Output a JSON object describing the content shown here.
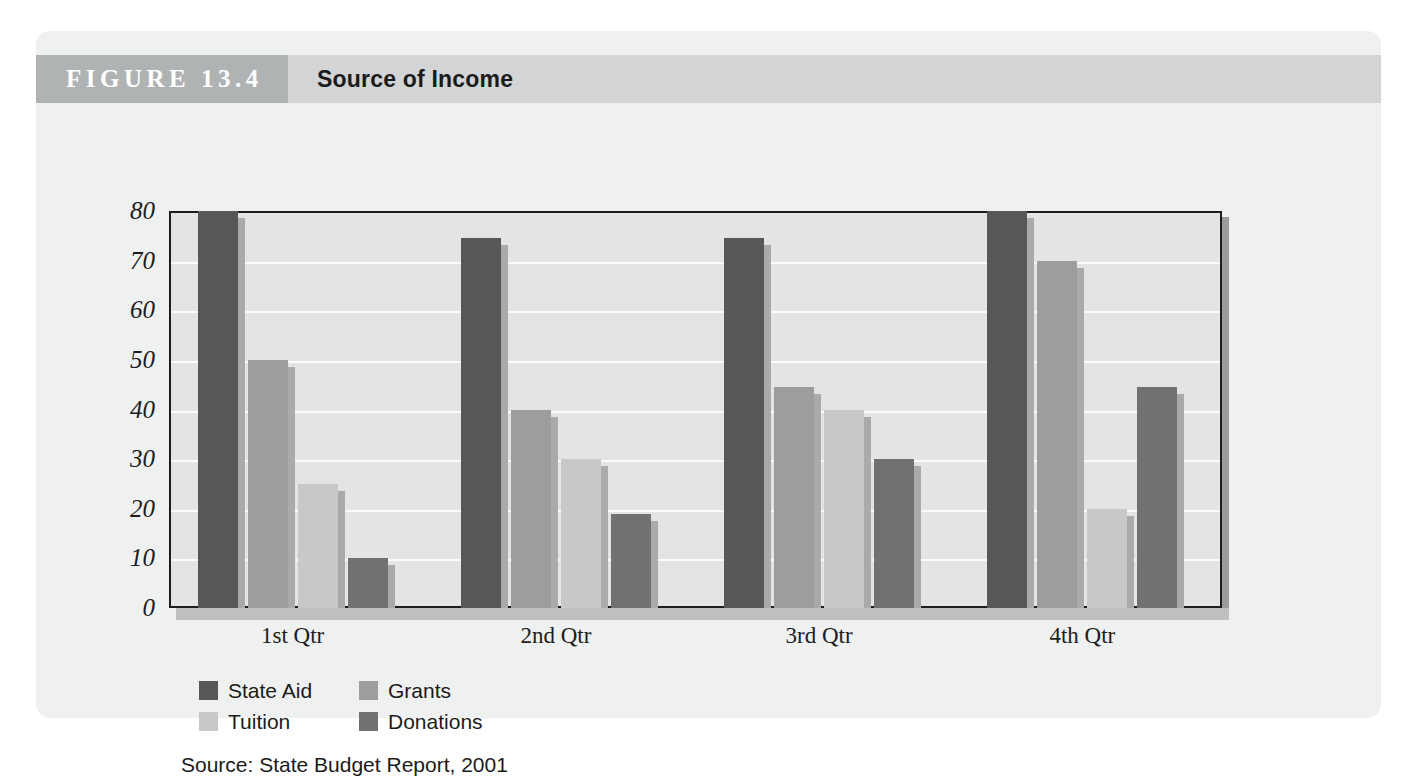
{
  "figure": {
    "tag": "FIGURE 13.4",
    "title": "Source of Income",
    "source_note": "Source: State Budget Report, 2001"
  },
  "chart_data": {
    "type": "bar",
    "title": "Source of Income",
    "xlabel": "",
    "ylabel": "",
    "ylim": [
      0,
      80
    ],
    "yticks": [
      0,
      10,
      20,
      30,
      40,
      50,
      60,
      70,
      80
    ],
    "ytick_labels": [
      "0",
      "10",
      "20",
      "30",
      "40",
      "50",
      "60",
      "70",
      "80"
    ],
    "grid": true,
    "legend_position": "bottom-left",
    "categories": [
      "1st Qtr",
      "2nd Qtr",
      "3rd Qtr",
      "4th Qtr"
    ],
    "series": [
      {
        "name": "State Aid",
        "color": "#555758",
        "values": [
          80,
          74.5,
          74.5,
          80
        ]
      },
      {
        "name": "Grants",
        "color": "#9b9d9e",
        "values": [
          50,
          40,
          44.5,
          70
        ]
      },
      {
        "name": "Tuition",
        "color": "#c6c8c9",
        "values": [
          25,
          30,
          40,
          20
        ]
      },
      {
        "name": "Donations",
        "color": "#6f7172",
        "values": [
          10,
          19,
          30,
          44.5
        ]
      }
    ]
  },
  "colors": {
    "card_background": "#eff0f0",
    "header_band": "#d2d4d5",
    "header_tag": "#b0b3b4",
    "plot_background": "#e3e4e5",
    "plot_border": "#1d1d1d",
    "gridline": "#fbfbfb",
    "bar_shadow": "#a8aaab"
  }
}
